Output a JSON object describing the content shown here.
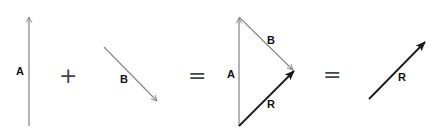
{
  "diagram": {
    "title": "",
    "type": "vector-addition",
    "colors": {
      "component_vector": "#8a8a8a",
      "resultant_vector": "#1a1a1a",
      "label": "#111111",
      "operator": "#444444",
      "background": "#ffffff"
    },
    "panels": [
      {
        "id": "vector-a",
        "vectors": [
          {
            "label": "A",
            "from": [
              29,
              126
            ],
            "to": [
              29,
              16
            ],
            "style": "gray-open-arrow"
          }
        ]
      },
      {
        "id": "plus",
        "symbol": "+"
      },
      {
        "id": "vector-b",
        "vectors": [
          {
            "label": "B",
            "from": [
              104,
              47
            ],
            "to": [
              157,
              101
            ],
            "style": "gray-open-arrow"
          }
        ]
      },
      {
        "id": "equals-1",
        "symbol": "="
      },
      {
        "id": "triangle",
        "vectors": [
          {
            "label": "A",
            "from": [
              239,
              126
            ],
            "to": [
              239,
              17
            ],
            "style": "gray-open-arrow"
          },
          {
            "label": "B",
            "from": [
              239,
              17
            ],
            "to": [
              293,
              70
            ],
            "style": "gray-open-arrow"
          },
          {
            "label": "R",
            "from": [
              239,
              126
            ],
            "to": [
              293,
              72
            ],
            "style": "black-filled-arrow"
          }
        ]
      },
      {
        "id": "equals-2",
        "symbol": "="
      },
      {
        "id": "resultant",
        "vectors": [
          {
            "label": "R",
            "from": [
              369,
              99
            ],
            "to": [
              424,
              43
            ],
            "style": "black-filled-arrow"
          }
        ]
      }
    ],
    "labels": {
      "a1": "A",
      "b1": "B",
      "a2": "A",
      "b2": "B",
      "r2": "R",
      "r3": "R"
    },
    "operators": {
      "plus": "+",
      "equals1": "=",
      "equals2": "="
    }
  }
}
